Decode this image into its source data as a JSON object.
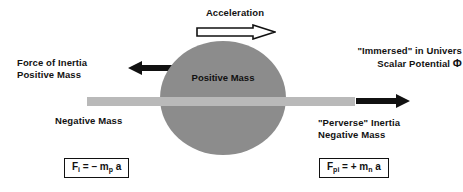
{
  "figure": {
    "background_color": "#ffffff",
    "sphere_color": "#8c8c8c",
    "rod_color": "#b9b9b9",
    "ink_color": "#111111"
  },
  "acceleration": {
    "label": "Acceleration",
    "arrow_direction": "right",
    "arrow_style": "hollow"
  },
  "left_annotation": {
    "line1": "Force of Inertia",
    "line2": "Positive Mass",
    "arrow_direction": "left",
    "arrow_style": "solid"
  },
  "right_annotation": {
    "line1": "\"Immersed\" in Univers",
    "line2_text": "Scalar Potential",
    "line2_symbol": "Φ"
  },
  "sphere": {
    "label": "Positive Mass"
  },
  "rod": {
    "label": "Negative Mass"
  },
  "perverse_annotation": {
    "line1": "\"Perverse\" Inertia",
    "line2": "Negative Mass",
    "arrow_direction": "right",
    "arrow_style": "solid"
  },
  "formulas": {
    "left": {
      "symbol": "F",
      "subscript": "i",
      "body": " = – m",
      "mass_subscript": "p",
      "tail": " a"
    },
    "right": {
      "symbol": "F",
      "subscript": "pi",
      "body": " = + m",
      "mass_subscript": "n",
      "tail": " a"
    }
  }
}
